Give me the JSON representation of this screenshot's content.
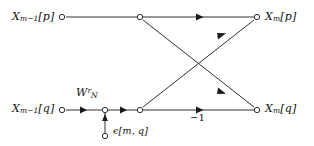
{
  "figure": {
    "type": "signal-flow-graph",
    "ink_color": "#1a1a1a",
    "background_color": "#ffffff"
  },
  "labels": {
    "input_top": {
      "base": "X",
      "sub": "m−1",
      "index": "[p]"
    },
    "input_bottom": {
      "base": "X",
      "sub": "m−1",
      "index": "[q]"
    },
    "output_top": {
      "base": "X",
      "sub": "m",
      "index": "[p]"
    },
    "output_bottom": {
      "base": "X",
      "sub": "m",
      "index": "[q]"
    },
    "twiddle": {
      "base": "W",
      "sub": "N",
      "sup": "r"
    },
    "error": {
      "base": "ϵ",
      "index": "[m, q]"
    },
    "gain": "−1"
  },
  "nodes": [
    {
      "name": "input-node-p",
      "x": 62,
      "y": 17,
      "kind": "open-circle"
    },
    {
      "name": "branch-node-p",
      "x": 140,
      "y": 17,
      "kind": "open-circle"
    },
    {
      "name": "output-node-p",
      "x": 257,
      "y": 17,
      "kind": "open-circle"
    },
    {
      "name": "input-node-q",
      "x": 62,
      "y": 110,
      "kind": "open-circle"
    },
    {
      "name": "error-sum-node",
      "x": 105,
      "y": 110,
      "kind": "open-circle"
    },
    {
      "name": "branch-node-q",
      "x": 140,
      "y": 110,
      "kind": "open-circle"
    },
    {
      "name": "output-node-q",
      "x": 257,
      "y": 110,
      "kind": "open-circle"
    },
    {
      "name": "error-source-node",
      "x": 105,
      "y": 136,
      "kind": "open-circle"
    }
  ],
  "edges": [
    {
      "name": "edge-input-p-to-branch-p",
      "from": [
        62,
        17
      ],
      "to": [
        140,
        17
      ],
      "arrow_at": null
    },
    {
      "name": "edge-branch-p-to-output-p",
      "from": [
        140,
        17
      ],
      "to": [
        257,
        17
      ],
      "arrow_at": [
        200,
        17
      ]
    },
    {
      "name": "edge-branch-p-to-output-q",
      "from": [
        140,
        17
      ],
      "to": [
        257,
        110
      ],
      "arrow_at": [
        228,
        95
      ]
    },
    {
      "name": "edge-branch-q-to-output-p",
      "from": [
        140,
        110
      ],
      "to": [
        257,
        17
      ],
      "arrow_at": [
        228,
        32
      ]
    },
    {
      "name": "edge-input-q-to-sum",
      "from": [
        62,
        110
      ],
      "to": [
        105,
        110
      ],
      "arrow_at": [
        84,
        110
      ]
    },
    {
      "name": "edge-sum-to-branch-q",
      "from": [
        105,
        110
      ],
      "to": [
        140,
        110
      ],
      "arrow_at": [
        124,
        110
      ]
    },
    {
      "name": "edge-branch-q-to-output-q",
      "from": [
        140,
        110
      ],
      "to": [
        257,
        110
      ],
      "arrow_at": [
        200,
        110
      ]
    },
    {
      "name": "edge-error-into-sum",
      "from": [
        105,
        133
      ],
      "to": [
        105,
        112
      ],
      "arrow_at": [
        105,
        116
      ]
    }
  ]
}
